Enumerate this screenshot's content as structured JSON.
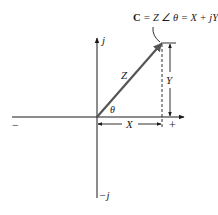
{
  "diagram": {
    "equation": {
      "bold_symbol": "C",
      "rest": " = Z ∠ θ = X + jY"
    },
    "labels": {
      "positive_imag_axis": "j",
      "negative_imag_axis": "−j",
      "negative_real_axis": "−",
      "positive_real_axis": "+",
      "magnitude": "Z",
      "angle": "θ",
      "real_component": "X",
      "imag_component": "Y"
    },
    "colors": {
      "line": "#1a1a1a",
      "vector": "#555555",
      "background": "#ffffff"
    }
  }
}
